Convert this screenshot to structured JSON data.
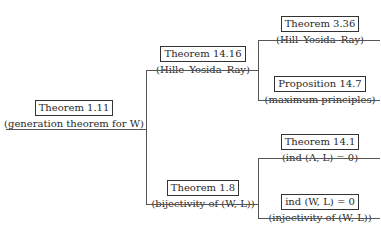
{
  "diagram": {
    "root": {
      "title": "Theorem 1.11",
      "subtitle": "(generation theorem for W)",
      "children": [
        {
          "title": "Theorem 14.16",
          "subtitle": "(Hille–Yosida–Ray)",
          "children": [
            {
              "title": "Theorem 3.36",
              "subtitle": "(Hill–Yosida–Ray)"
            },
            {
              "title": "Proposition 14.7",
              "subtitle": "(maximum principles)"
            }
          ]
        },
        {
          "title": "Theorem 1.8",
          "subtitle": "(bijectivity of (W, L))",
          "children": [
            {
              "title": "Theorem 14.1",
              "subtitle": "(ind (A, L) = 0)"
            },
            {
              "title": "ind (W, L) = 0",
              "subtitle": "(injectivity of (W, L))"
            }
          ]
        }
      ]
    }
  }
}
